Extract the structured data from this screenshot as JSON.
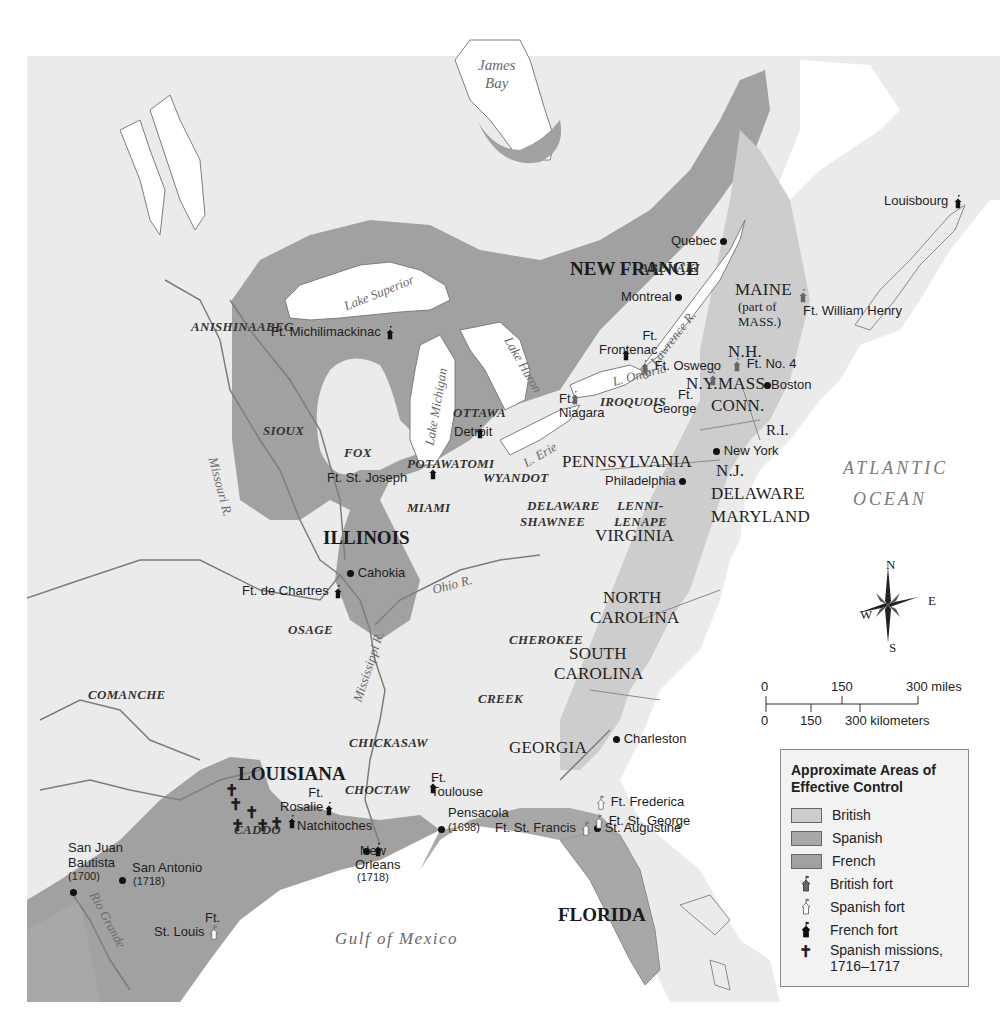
{
  "colors": {
    "land": "#ebebeb",
    "water": "#ffffff",
    "british": "#cdcdcd",
    "spanish": "#a8a8a8",
    "french": "#a1a1a1",
    "river": "#7d7d7d",
    "border": "#8a8a8a"
  },
  "regions": {
    "new_france": "NEW FRANCE",
    "illinois": "ILLINOIS",
    "louisiana": "LOUISIANA",
    "florida": "FLORIDA",
    "maine": "MAINE",
    "maine_note1": "(part of",
    "maine_note2": "MASS.)",
    "nh": "N.H.",
    "ny": "N.Y.",
    "mass": "MASS.",
    "conn": "CONN.",
    "ri": "R.I.",
    "nj": "N.J.",
    "pennsylvania": "PENNSYLVANIA",
    "delaware": "DELAWARE",
    "maryland": "MARYLAND",
    "virginia": "VIRGINIA",
    "north_carolina_1": "NORTH",
    "north_carolina_2": "CAROLINA",
    "south_carolina_1": "SOUTH",
    "south_carolina_2": "CAROLINA",
    "georgia": "GEORGIA"
  },
  "tribes": {
    "abenaki": "ABENAKI",
    "anishinaabeg": "ANISHINAABEG",
    "sioux": "SIOUX",
    "fox": "FOX",
    "ottawa": "OTTAWA",
    "potawatomi": "POTAWATOMI",
    "wyandot": "WYANDOT",
    "miami": "MIAMI",
    "iroquois": "IROQUOIS",
    "delaware_shawnee_1": "DELAWARE",
    "delaware_shawnee_2": "SHAWNEE",
    "lenni_lenape_1": "LENNI-",
    "lenni_lenape_2": "LENAPE",
    "osage": "OSAGE",
    "cherokee": "CHEROKEE",
    "comanche": "COMANCHE",
    "creek": "CREEK",
    "chickasaw": "CHICKASAW",
    "choctaw": "CHOCTAW",
    "caddo": "CADDO"
  },
  "water": {
    "james_bay_1": "James",
    "james_bay_2": "Bay",
    "lake_superior": "Lake Superior",
    "lake_michigan": "Lake Michigan",
    "lake_huron": "Lake Huron",
    "lake_ontario": "L. Ontario",
    "lake_erie": "L. Erie",
    "st_lawrence": "St. Lawrence R.",
    "missouri": "Missouri R.",
    "ohio": "Ohio R.",
    "mississippi": "Mississippi R.",
    "rio_grande": "Rio Grande",
    "gulf": "Gulf of Mexico",
    "atlantic_1": "ATLANTIC",
    "atlantic_2": "OCEAN"
  },
  "places": {
    "quebec": "Quebec",
    "montreal": "Montreal",
    "boston": "Boston",
    "new_york": "New York",
    "philadelphia": "Philadelphia",
    "charleston": "Charleston",
    "st_augustine": "St. Augustine",
    "pensacola": "Pensacola",
    "pensacola_year": "(1698)",
    "new_orleans_1": "New",
    "new_orleans_2": "Orleans",
    "new_orleans_year": "(1718)",
    "natchitoches": "Natchitoches",
    "san_antonio": "San Antonio",
    "san_antonio_year": "(1718)",
    "san_juan_1": "San Juan",
    "san_juan_2": "Bautista",
    "san_juan_year": "(1700)",
    "cahokia": "Cahokia",
    "detroit": "Detroit"
  },
  "forts": {
    "louisbourg": "Louisbourg",
    "william_henry": "Ft. William Henry",
    "michilimackinac": "Ft. Michilimackinac",
    "frontenac_1": "Ft.",
    "frontenac_2": "Frontenac",
    "oswego": "Ft. Oswego",
    "no4": "Ft. No. 4",
    "george_1": "Ft.",
    "george_2": "George",
    "niagara_1": "Ft.",
    "niagara_2": "Niagara",
    "st_joseph": "Ft. St. Joseph",
    "de_chartres": "Ft. de Chartres",
    "rosalie_1": "Ft.",
    "rosalie_2": "Rosalie",
    "toulouse_1": "Ft.",
    "toulouse_2": "Toulouse",
    "frederica": "Ft. Frederica",
    "st_george": "Ft. St. George",
    "st_francis": "Ft. St. Francis",
    "st_louis_1": "Ft.",
    "st_louis_2": "St. Louis"
  },
  "compass": {
    "n": "N",
    "s": "S",
    "e": "E",
    "w": "W"
  },
  "scale": {
    "miles_0": "0",
    "miles_150": "150",
    "miles_300": "300 miles",
    "km_0": "0",
    "km_150": "150",
    "km_300": "300 kilometers"
  },
  "legend": {
    "title": "Approximate Areas of Effective Control",
    "items": [
      {
        "label": "British",
        "type": "swatch",
        "color": "#cdcdcd"
      },
      {
        "label": "Spanish",
        "type": "swatch",
        "color": "#a8a8a8"
      },
      {
        "label": "French",
        "type": "swatch",
        "color": "#a1a1a1"
      },
      {
        "label": "British fort",
        "type": "icon",
        "icon": "british-fort-icon"
      },
      {
        "label": "Spanish fort",
        "type": "icon",
        "icon": "spanish-fort-icon"
      },
      {
        "label": "French fort",
        "type": "icon",
        "icon": "french-fort-icon"
      },
      {
        "label": "Spanish missions, 1716–1717",
        "type": "icon",
        "icon": "spanish-mission-icon"
      }
    ]
  }
}
